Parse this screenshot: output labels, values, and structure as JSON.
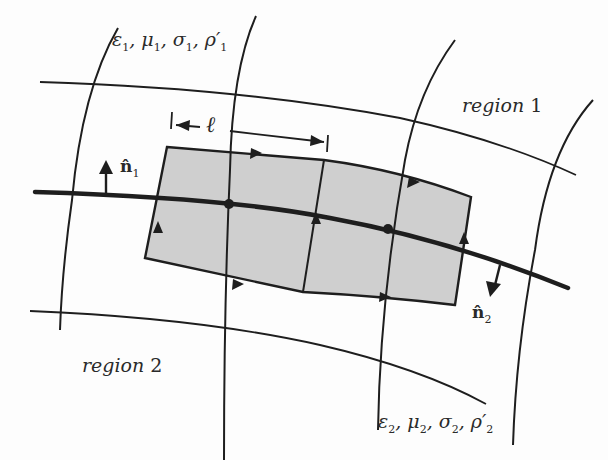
{
  "diagram": {
    "colors": {
      "line": "#1e1e1e",
      "box_fill": "#cfcfcf",
      "background": "#fdfdfd",
      "text": "#2a2a2a"
    },
    "labels": {
      "region1": {
        "word": "region",
        "num": "1"
      },
      "region2": {
        "word": "region",
        "num": "2"
      },
      "params1": {
        "eps": "ε",
        "eps_sub": "1",
        "mu": "μ",
        "mu_sub": "1",
        "sigma": "σ",
        "sigma_sub": "1",
        "rho": "ρ′",
        "rho_sub": "1",
        "sep": ","
      },
      "params2": {
        "eps": "ε",
        "eps_sub": "2",
        "mu": "μ",
        "mu_sub": "2",
        "sigma": "σ",
        "sigma_sub": "2",
        "rho": "ρ′",
        "rho_sub": "2",
        "sep": ","
      },
      "normal1": {
        "symbol": "n̂",
        "sub": "1"
      },
      "normal2": {
        "symbol": "n̂",
        "sub": "2"
      },
      "length": "ℓ"
    },
    "elements": [
      "interface-curve",
      "grid-curves",
      "shaded-box-rectangular-loops",
      "loop-direction-arrows",
      "normal-vector-n1",
      "normal-vector-n2",
      "length-dimension-l"
    ]
  }
}
